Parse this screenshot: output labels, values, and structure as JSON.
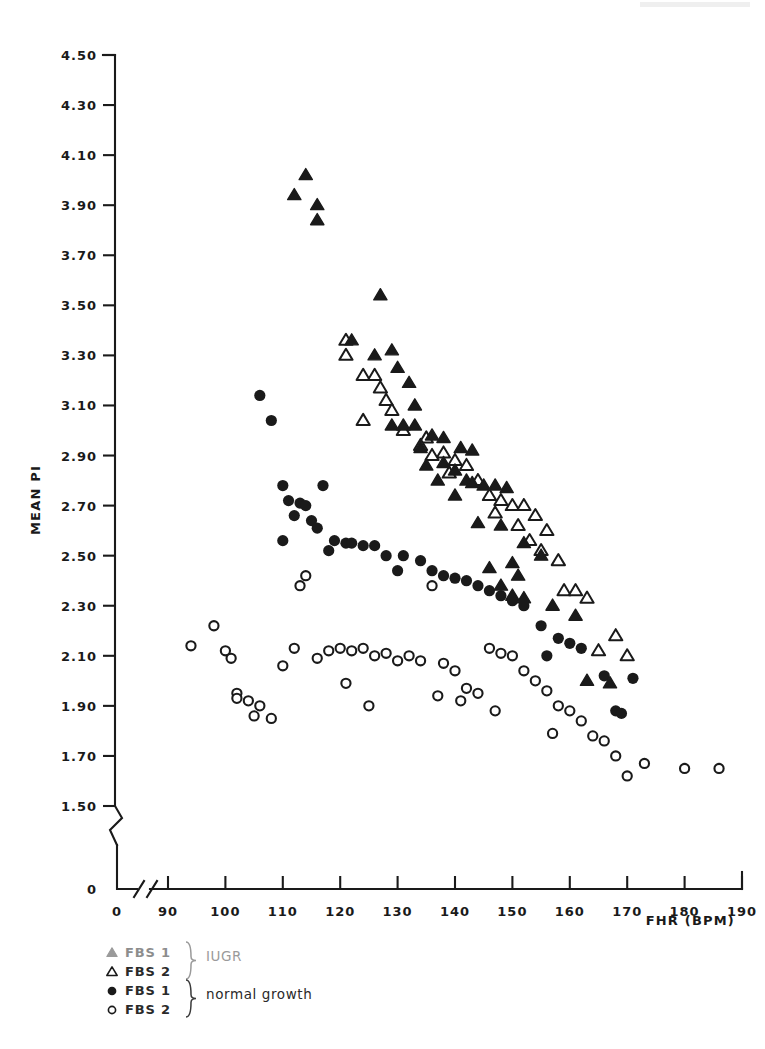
{
  "chart_data": {
    "type": "scatter",
    "title": "",
    "xlabel": "FHR (BPM)",
    "ylabel": "MEAN PI",
    "xlim": [
      90,
      190
    ],
    "ylim": [
      1.5,
      4.5
    ],
    "axis_break_x": true,
    "axis_break_y": true,
    "grid": false,
    "legend_position": "below-left",
    "x_ticks": [
      "0",
      "90",
      "100",
      "110",
      "120",
      "130",
      "140",
      "150",
      "160",
      "170",
      "180",
      "190"
    ],
    "y_ticks": [
      "4.50",
      "4.30",
      "4.10",
      "3.90",
      "3.70",
      "3.50",
      "3.30",
      "3.10",
      "2.90",
      "2.70",
      "2.50",
      "2.30",
      "2.10",
      "1.90",
      "1.70",
      "1.50",
      "0"
    ],
    "series": [
      {
        "name": "FBS 1",
        "group": "IUGR",
        "marker": "filled-triangle",
        "color": "#1a1a1a",
        "points": [
          [
            114,
            4.02
          ],
          [
            112,
            3.94
          ],
          [
            116,
            3.9
          ],
          [
            116,
            3.84
          ],
          [
            127,
            3.54
          ],
          [
            122,
            3.36
          ],
          [
            126,
            3.3
          ],
          [
            129,
            3.32
          ],
          [
            130,
            3.25
          ],
          [
            132,
            3.19
          ],
          [
            133,
            3.1
          ],
          [
            129,
            3.02
          ],
          [
            131,
            3.02
          ],
          [
            133,
            3.02
          ],
          [
            136,
            2.98
          ],
          [
            138,
            2.97
          ],
          [
            134,
            2.93
          ],
          [
            141,
            2.93
          ],
          [
            143,
            2.92
          ],
          [
            138,
            2.87
          ],
          [
            135,
            2.86
          ],
          [
            140,
            2.84
          ],
          [
            137,
            2.8
          ],
          [
            142,
            2.8
          ],
          [
            143,
            2.79
          ],
          [
            145,
            2.78
          ],
          [
            147,
            2.78
          ],
          [
            149,
            2.77
          ],
          [
            140,
            2.74
          ],
          [
            144,
            2.63
          ],
          [
            148,
            2.62
          ],
          [
            152,
            2.55
          ],
          [
            155,
            2.5
          ],
          [
            150,
            2.47
          ],
          [
            146,
            2.45
          ],
          [
            151,
            2.42
          ],
          [
            148,
            2.38
          ],
          [
            150,
            2.34
          ],
          [
            152,
            2.33
          ],
          [
            157,
            2.3
          ],
          [
            161,
            2.26
          ],
          [
            163,
            2.0
          ],
          [
            167,
            1.99
          ]
        ]
      },
      {
        "name": "FBS 2",
        "group": "IUGR",
        "marker": "open-triangle",
        "color": "#1a1a1a",
        "points": [
          [
            121,
            3.36
          ],
          [
            121,
            3.3
          ],
          [
            124,
            3.22
          ],
          [
            126,
            3.22
          ],
          [
            127,
            3.17
          ],
          [
            128,
            3.12
          ],
          [
            129,
            3.08
          ],
          [
            124,
            3.04
          ],
          [
            131,
            3.0
          ],
          [
            135,
            2.97
          ],
          [
            134,
            2.94
          ],
          [
            138,
            2.91
          ],
          [
            136,
            2.9
          ],
          [
            140,
            2.88
          ],
          [
            142,
            2.86
          ],
          [
            139,
            2.83
          ],
          [
            144,
            2.8
          ],
          [
            146,
            2.74
          ],
          [
            148,
            2.72
          ],
          [
            150,
            2.7
          ],
          [
            152,
            2.7
          ],
          [
            147,
            2.67
          ],
          [
            154,
            2.66
          ],
          [
            151,
            2.62
          ],
          [
            156,
            2.6
          ],
          [
            153,
            2.56
          ],
          [
            155,
            2.52
          ],
          [
            158,
            2.48
          ],
          [
            159,
            2.36
          ],
          [
            161,
            2.36
          ],
          [
            163,
            2.33
          ],
          [
            168,
            2.18
          ],
          [
            165,
            2.12
          ],
          [
            170,
            2.1
          ]
        ]
      },
      {
        "name": "FBS 1",
        "group": "normal growth",
        "marker": "filled-circle",
        "color": "#1a1a1a",
        "points": [
          [
            106,
            3.14
          ],
          [
            108,
            3.04
          ],
          [
            110,
            2.78
          ],
          [
            117,
            2.78
          ],
          [
            111,
            2.72
          ],
          [
            113,
            2.71
          ],
          [
            114,
            2.7
          ],
          [
            112,
            2.66
          ],
          [
            115,
            2.64
          ],
          [
            116,
            2.61
          ],
          [
            110,
            2.56
          ],
          [
            119,
            2.56
          ],
          [
            121,
            2.55
          ],
          [
            122,
            2.55
          ],
          [
            124,
            2.54
          ],
          [
            126,
            2.54
          ],
          [
            118,
            2.52
          ],
          [
            128,
            2.5
          ],
          [
            131,
            2.5
          ],
          [
            134,
            2.48
          ],
          [
            130,
            2.44
          ],
          [
            136,
            2.44
          ],
          [
            138,
            2.42
          ],
          [
            140,
            2.41
          ],
          [
            142,
            2.4
          ],
          [
            144,
            2.38
          ],
          [
            146,
            2.36
          ],
          [
            148,
            2.34
          ],
          [
            150,
            2.32
          ],
          [
            152,
            2.3
          ],
          [
            155,
            2.22
          ],
          [
            158,
            2.17
          ],
          [
            160,
            2.15
          ],
          [
            162,
            2.13
          ],
          [
            156,
            2.1
          ],
          [
            166,
            2.02
          ],
          [
            171,
            2.01
          ],
          [
            168,
            1.88
          ],
          [
            169,
            1.87
          ]
        ]
      },
      {
        "name": "FBS 2",
        "group": "normal growth",
        "marker": "open-circle",
        "color": "#1a1a1a",
        "points": [
          [
            94,
            2.14
          ],
          [
            100,
            2.12
          ],
          [
            98,
            2.22
          ],
          [
            101,
            2.09
          ],
          [
            102,
            1.95
          ],
          [
            102,
            1.93
          ],
          [
            104,
            1.92
          ],
          [
            106,
            1.9
          ],
          [
            105,
            1.86
          ],
          [
            108,
            1.85
          ],
          [
            110,
            2.06
          ],
          [
            112,
            2.13
          ],
          [
            114,
            2.42
          ],
          [
            113,
            2.38
          ],
          [
            116,
            2.09
          ],
          [
            118,
            2.12
          ],
          [
            120,
            2.13
          ],
          [
            122,
            2.12
          ],
          [
            121,
            1.99
          ],
          [
            124,
            2.13
          ],
          [
            126,
            2.1
          ],
          [
            128,
            2.11
          ],
          [
            125,
            1.9
          ],
          [
            130,
            2.08
          ],
          [
            132,
            2.1
          ],
          [
            134,
            2.08
          ],
          [
            136,
            2.38
          ],
          [
            138,
            2.07
          ],
          [
            140,
            2.04
          ],
          [
            137,
            1.94
          ],
          [
            142,
            1.97
          ],
          [
            144,
            1.95
          ],
          [
            141,
            1.92
          ],
          [
            146,
            2.13
          ],
          [
            148,
            2.11
          ],
          [
            150,
            2.1
          ],
          [
            152,
            2.04
          ],
          [
            147,
            1.88
          ],
          [
            154,
            2.0
          ],
          [
            156,
            1.96
          ],
          [
            158,
            1.9
          ],
          [
            160,
            1.88
          ],
          [
            162,
            1.84
          ],
          [
            157,
            1.79
          ],
          [
            164,
            1.78
          ],
          [
            166,
            1.76
          ],
          [
            168,
            1.7
          ],
          [
            170,
            1.62
          ],
          [
            173,
            1.67
          ],
          [
            180,
            1.65
          ],
          [
            186,
            1.65
          ]
        ]
      }
    ]
  },
  "legend": {
    "rows": [
      {
        "marker": "filled-triangle",
        "label": "FBS 1",
        "faded": true
      },
      {
        "marker": "open-triangle",
        "label": "FBS 2",
        "faded": false
      },
      {
        "marker": "filled-circle",
        "label": "FBS 1",
        "faded": false
      },
      {
        "marker": "open-circle",
        "label": "FBS 2",
        "faded": false
      }
    ],
    "groups": [
      {
        "label": "IUGR",
        "faded": true
      },
      {
        "label": "normal growth",
        "faded": false
      }
    ]
  }
}
